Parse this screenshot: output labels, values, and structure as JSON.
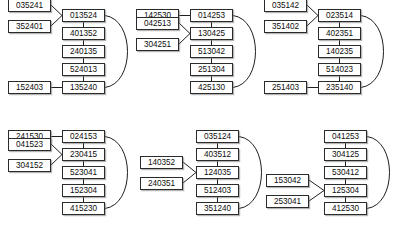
{
  "figure": {
    "type": "diagram",
    "node_digits": 6,
    "panel_count": 6
  },
  "panels": [
    {
      "id": "panel-1",
      "x": 6,
      "y": 9,
      "main_column_x": 62,
      "side_column_x": 8,
      "main": [
        "013524",
        "401352",
        "240135",
        "524013",
        "135240"
      ],
      "branch": {
        "attach_row": 0,
        "fork": true,
        "labels": [
          "035241",
          "352401"
        ]
      },
      "tail": {
        "attach_row": 4,
        "fork": false,
        "labels": [
          "152403"
        ]
      },
      "back_edge": {
        "from_row": 0,
        "to_row": 4,
        "side": "right"
      }
    },
    {
      "id": "panel-2",
      "x": 134,
      "y": 9,
      "main_column_x": 190,
      "side_column_x": 136,
      "main": [
        "014253",
        "130425",
        "513042",
        "251304",
        "425130"
      ],
      "branch": {
        "attach_row": 0,
        "fork": false,
        "labels": [
          "142530"
        ]
      },
      "tail": {
        "attach_row": 1,
        "fork": true,
        "labels": [
          "042513",
          "304251"
        ]
      },
      "back_edge": {
        "from_row": 0,
        "to_row": 4,
        "side": "right"
      }
    },
    {
      "id": "panel-3",
      "x": 262,
      "y": 9,
      "main_column_x": 318,
      "side_column_x": 264,
      "main": [
        "023514",
        "402351",
        "140235",
        "514023",
        "235140"
      ],
      "branch": {
        "attach_row": 0,
        "fork": true,
        "labels": [
          "035142",
          "351402"
        ]
      },
      "tail": {
        "attach_row": 4,
        "fork": false,
        "labels": [
          "251403"
        ]
      },
      "back_edge": {
        "from_row": 0,
        "to_row": 4,
        "side": "right"
      }
    },
    {
      "id": "panel-4",
      "x": 6,
      "y": 130,
      "main_column_x": 62,
      "side_column_x": 8,
      "main": [
        "024153",
        "230415",
        "523041",
        "152304",
        "415230"
      ],
      "branch": {
        "attach_row": 0,
        "fork": false,
        "labels": [
          "241530"
        ]
      },
      "tail": {
        "attach_row": 1,
        "fork": true,
        "labels": [
          "041523",
          "304152"
        ]
      },
      "back_edge": {
        "from_row": 0,
        "to_row": 4,
        "side": "right"
      }
    },
    {
      "id": "panel-5",
      "x": 134,
      "y": 130,
      "main_column_x": 196,
      "side_column_x": 140,
      "main": [
        "035124",
        "403512",
        "124035",
        "512403",
        "351240"
      ],
      "branch": {
        "attach_row": 2,
        "fork": true,
        "labels": [
          "140352",
          "240351"
        ]
      },
      "tail": null,
      "back_edge": {
        "from_row": 0,
        "to_row": 4,
        "side": "right"
      }
    },
    {
      "id": "panel-6",
      "x": 262,
      "y": 130,
      "main_column_x": 324,
      "side_column_x": 266,
      "main": [
        "041253",
        "304125",
        "530412",
        "125304",
        "412530"
      ],
      "branch": {
        "attach_row": 3,
        "fork": true,
        "labels": [
          "153042",
          "253041"
        ]
      },
      "tail": null,
      "back_edge": {
        "from_row": 0,
        "to_row": 4,
        "side": "right"
      }
    }
  ],
  "geometry": {
    "row_pitch": 18,
    "node_width": 43,
    "node_height": 13,
    "fork_offset": 21
  },
  "colors": {
    "node_fill": "#ffffff",
    "node_border": "#2b2b2b",
    "edge": "#1f1f1f",
    "text": "#0d0d0d",
    "background": "#ffffff"
  }
}
